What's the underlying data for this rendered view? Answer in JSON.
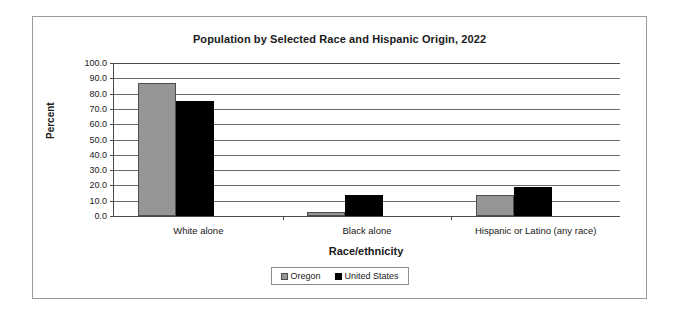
{
  "chart_data": {
    "type": "bar",
    "title": "Population by Selected Race and Hispanic Origin, 2022",
    "xlabel": "Race/ethnicity",
    "ylabel": "Percent",
    "categories": [
      "White alone",
      "Black alone",
      "Hispanic or Latino (any race)"
    ],
    "series": [
      {
        "name": "Oregon",
        "color": "#969696",
        "values": [
          86.7,
          2.3,
          13.8
        ]
      },
      {
        "name": "United States",
        "color": "#000000",
        "values": [
          75.5,
          13.6,
          19.1
        ]
      }
    ],
    "ylim": [
      0,
      100
    ],
    "yticks": [
      "0.0",
      "10.0",
      "20.0",
      "30.0",
      "40.0",
      "50.0",
      "60.0",
      "70.0",
      "80.0",
      "90.0",
      "100.0"
    ],
    "ytick_values": [
      0,
      10,
      20,
      30,
      40,
      50,
      60,
      70,
      80,
      90,
      100
    ],
    "grid": true,
    "grid_axis": "y",
    "legend_position": "bottom"
  }
}
